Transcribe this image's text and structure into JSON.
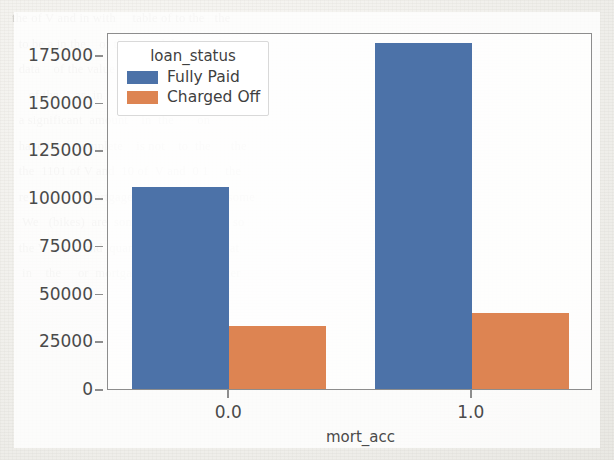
{
  "page": {
    "background_note": "scanned book page with faint show-through text",
    "ghost_text": "the of V and in with     table of to the   the\n  to be a in the    of the     and the  in   of\n  data    of the value    for in the    or the\n     of the     as  in     the   of    an\n  a significant  amount    in  the       on\n  have the    complete    is not    to  the      the\n  the  1101 of V and  10 of  V and  0 1     the\n  re   related   mortgage   (jokes)  with  a  some\n   We   (bikes)  are  some of   the  diff        so\n  the V    of    and  quantity    is   to    the  at\n   in    the     or  mortgage   of     that   lower"
  },
  "chart_data": {
    "type": "bar",
    "title": "",
    "xlabel": "mort_acc",
    "ylabel": "",
    "categories": [
      "0.0",
      "1.0"
    ],
    "series": [
      {
        "name": "Fully Paid",
        "color": "#4c72a8",
        "values": [
          106000,
          181000
        ]
      },
      {
        "name": "Charged Off",
        "color": "#dd8452",
        "values": [
          33000,
          40000
        ]
      }
    ],
    "ylim": [
      0,
      187000
    ],
    "yticks": [
      0,
      25000,
      50000,
      75000,
      100000,
      125000,
      150000,
      175000
    ],
    "ytick_labels": [
      "0",
      "25000",
      "50000",
      "75000",
      "100000",
      "125000",
      "150000",
      "175000"
    ],
    "xticks": [
      0,
      1
    ],
    "xtick_labels": [
      "0.0",
      "1.0"
    ],
    "grid": false,
    "legend": {
      "title": "loan_status",
      "position": "upper left",
      "entries": [
        {
          "label": "Fully Paid",
          "color": "#4c72a8"
        },
        {
          "label": "Charged Off",
          "color": "#dd8452"
        }
      ]
    }
  }
}
